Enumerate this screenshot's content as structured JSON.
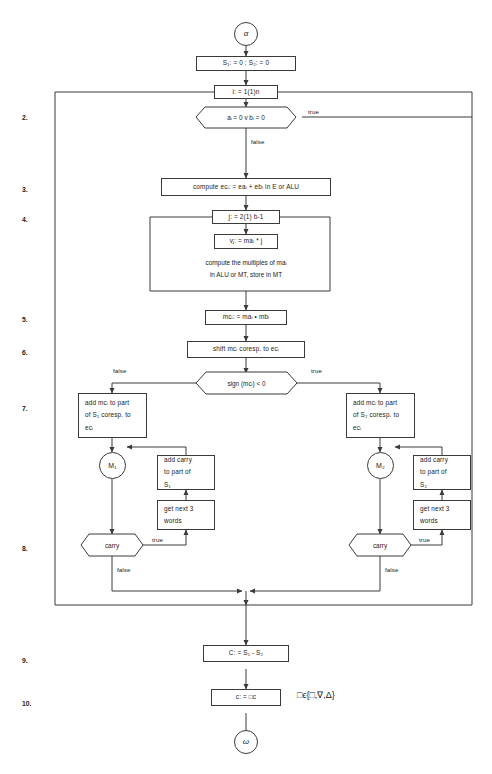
{
  "diagram": {
    "stroke_color": "#3a3a3a",
    "text_color": "#1a1a1a",
    "background": "#ffffff",
    "terminals": {
      "start": "α",
      "end": "ω"
    },
    "connectors": {
      "m1": "M₁",
      "m2": "M₂"
    },
    "step_numbers": [
      {
        "label": "2.",
        "y": 114
      },
      {
        "label": "3.",
        "y": 186
      },
      {
        "label": "4.",
        "y": 216
      },
      {
        "label": "5.",
        "y": 316
      },
      {
        "label": "6.",
        "y": 349
      },
      {
        "label": "7.",
        "y": 405
      },
      {
        "label": "8.",
        "y": 545
      },
      {
        "label": "9.",
        "y": 657
      },
      {
        "label": "10.",
        "y": 700
      }
    ],
    "nodes": {
      "init_sums": "S₁: = 0 ; S₂: = 0",
      "loop_i": "i: = 1(1)n",
      "test_zero": "aᵢ = 0 v bᵢ = 0",
      "compute_ec": "compute  ecᵢ: = eaᵢ + ebᵢ in E or ALU",
      "loop_j": "j: = 2(1) b-1",
      "v_assign": "vⱼ: = maᵢ * j",
      "multiples_note_line1": "compute the multiples of maᵢ",
      "multiples_note_line2": "in ALU or MT, store in MT",
      "mc_assign": "mcᵢ: = maᵢ • mbᵢ",
      "shift_mc": "shift mcᵢ coresp. to ecᵢ",
      "sign_test": "sign (mcᵢ) < 0",
      "add_left_line1": "add mcᵢ to part",
      "add_left_line2": "of S₁ coresp. to",
      "add_left_line3": "ecᵢ",
      "add_right_line1": "add mcᵢ to part",
      "add_right_line2": "of S₂ coresp. to",
      "add_right_line3": "ecᵢ",
      "carry_left_line1": "add carry",
      "carry_left_line2": "to part of",
      "carry_left_line3": "S₁",
      "carry_right_line1": "add carry",
      "carry_right_line2": "to part of",
      "carry_right_line3": "S₂",
      "words_left_line1": "get  next 3",
      "words_left_line2": "words",
      "words_right_line1": "get next 3",
      "words_right_line2": "words",
      "carry_test_left": "carry",
      "carry_test_right": "carry",
      "c_assign": "C: = S₁ - S₂",
      "c_final": "c: = □c",
      "set_note": "□ϵ{□,∇,Δ}"
    },
    "edge_labels": {
      "true_top": "true",
      "false_top": "false",
      "false_sign": "false",
      "true_sign": "true",
      "true_carry_left": "true",
      "false_carry_left": "false",
      "true_carry_right": "true",
      "false_carry_right": "false"
    }
  }
}
